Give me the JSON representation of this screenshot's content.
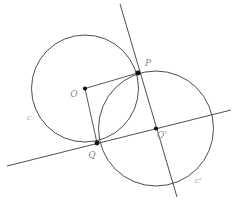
{
  "diagram": {
    "background_color": "#ffffff",
    "stroke_color": "#3a3a3a",
    "point_color": "#111111",
    "label_color": "#8a8a8a",
    "curve_label_color": "#a5a5a5",
    "width": 234,
    "height": 210
  },
  "labels": {
    "center_left": "O",
    "center_right": "O'",
    "intersection_top": "P",
    "intersection_bottom": "Q",
    "circle_left": "c",
    "circle_right": "c'"
  },
  "chart_data": {
    "type": "scatter",
    "xlabel": "",
    "ylabel": "",
    "xlim": [
      0,
      234
    ],
    "ylim": [
      210,
      0
    ],
    "grid": false,
    "legend": "none",
    "circles": [
      {
        "name": "c",
        "label": "c",
        "center_label": "O",
        "cx": 85,
        "cy": 88.5,
        "r": 53.5,
        "label_x": 29,
        "label_y": 120
      },
      {
        "name": "c'",
        "label": "c'",
        "center_label": "O'",
        "cx": 156,
        "cy": 128.5,
        "r": 57.5,
        "label_x": 198,
        "label_y": 183
      }
    ],
    "points": [
      {
        "name": "O",
        "label": "O",
        "x": 85,
        "y": 88.5,
        "label_x": 74,
        "label_y": 97,
        "dot": true
      },
      {
        "name": "O'",
        "label": "O'",
        "x": 156,
        "y": 128.5,
        "label_x": 162,
        "label_y": 138,
        "dot": true
      },
      {
        "name": "P",
        "label": "P",
        "x": 138,
        "y": 73,
        "label_x": 148,
        "label_y": 66,
        "dot": true
      },
      {
        "name": "Q",
        "label": "Q",
        "x": 97,
        "y": 143,
        "label_x": 92,
        "label_y": 158,
        "dot": true
      }
    ],
    "lines": [
      {
        "name": "radical-axis",
        "description": "steep line through P and Q extended",
        "x1": 120,
        "y1": 4,
        "x2": 177,
        "y2": 197
      },
      {
        "name": "center-line",
        "description": "shallow line through Q and O' extended",
        "x1": 7,
        "y1": 166,
        "x2": 231,
        "y2": 110
      }
    ],
    "segments": [
      {
        "name": "radius-OP",
        "x1": 85,
        "y1": 88.5,
        "x2": 138,
        "y2": 73
      },
      {
        "name": "radius-OQ",
        "x1": 85,
        "y1": 88.5,
        "x2": 97,
        "y2": 143
      }
    ]
  }
}
